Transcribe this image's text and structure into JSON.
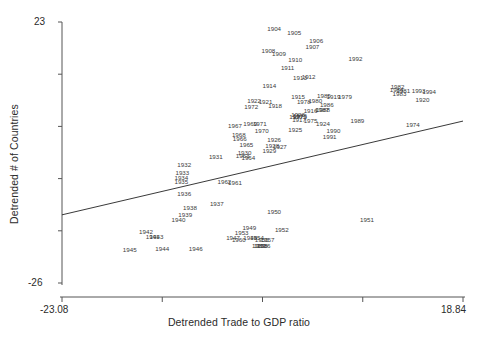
{
  "chart_data": {
    "type": "scatter",
    "title": "",
    "xlabel": "Detrended Trade to GDP ratio",
    "ylabel": "Detrended # of Countries",
    "xlim": [
      -23.08,
      18.84
    ],
    "ylim": [
      -26,
      23
    ],
    "xticklabels": [
      "-23.08",
      "18.84"
    ],
    "yticklabels": [
      "23",
      "-26"
    ],
    "grid": false,
    "legend": null,
    "point_label_field": "year",
    "marker": "text-label",
    "trendline": {
      "type": "linear",
      "x": [
        -23.08,
        18.84
      ],
      "y": [
        -13.2,
        4.4
      ]
    },
    "points": [
      {
        "year": "1904",
        "x": -0.9,
        "y": 21.6
      },
      {
        "year": "1905",
        "x": 1.2,
        "y": 21.0
      },
      {
        "year": "1906",
        "x": 3.5,
        "y": 19.4
      },
      {
        "year": "1907",
        "x": 3.1,
        "y": 18.3
      },
      {
        "year": "1908",
        "x": -1.5,
        "y": 17.6
      },
      {
        "year": "1909",
        "x": -0.4,
        "y": 17.0
      },
      {
        "year": "1910",
        "x": 1.3,
        "y": 15.8
      },
      {
        "year": "1911",
        "x": 0.5,
        "y": 14.4
      },
      {
        "year": "1912",
        "x": 2.7,
        "y": 12.6
      },
      {
        "year": "1913",
        "x": 1.8,
        "y": 12.4
      },
      {
        "year": "1914",
        "x": -1.4,
        "y": 11.0
      },
      {
        "year": "1915",
        "x": 1.6,
        "y": 9.0
      },
      {
        "year": "1916",
        "x": 2.9,
        "y": 6.2
      },
      {
        "year": "1917",
        "x": 1.7,
        "y": 4.6
      },
      {
        "year": "1918",
        "x": -0.8,
        "y": 7.2
      },
      {
        "year": "1919",
        "x": 5.3,
        "y": 9.0
      },
      {
        "year": "1920",
        "x": 14.6,
        "y": 8.4
      },
      {
        "year": "1921",
        "x": -1.8,
        "y": 8.0
      },
      {
        "year": "1922",
        "x": -3.0,
        "y": 8.2
      },
      {
        "year": "1923",
        "x": 1.6,
        "y": 5.6
      },
      {
        "year": "1924",
        "x": 4.2,
        "y": 3.8
      },
      {
        "year": "1925",
        "x": 1.3,
        "y": 2.8
      },
      {
        "year": "1926",
        "x": -0.9,
        "y": 0.8
      },
      {
        "year": "1927",
        "x": -0.3,
        "y": -0.5
      },
      {
        "year": "1928",
        "x": -1.1,
        "y": -0.3
      },
      {
        "year": "1929",
        "x": -1.4,
        "y": -1.2
      },
      {
        "year": "1930",
        "x": -4.0,
        "y": -1.5
      },
      {
        "year": "1931",
        "x": -7.0,
        "y": -2.4
      },
      {
        "year": "1932",
        "x": -10.3,
        "y": -3.8
      },
      {
        "year": "1933",
        "x": -10.5,
        "y": -5.4
      },
      {
        "year": "1934",
        "x": -10.6,
        "y": -6.2
      },
      {
        "year": "1935",
        "x": -10.6,
        "y": -7.0
      },
      {
        "year": "1936",
        "x": -10.3,
        "y": -9.3
      },
      {
        "year": "1937",
        "x": -6.9,
        "y": -11.2
      },
      {
        "year": "1938",
        "x": -9.7,
        "y": -11.9
      },
      {
        "year": "1939",
        "x": -10.2,
        "y": -13.2
      },
      {
        "year": "1940",
        "x": -10.9,
        "y": -14.1
      },
      {
        "year": "1941",
        "x": -13.6,
        "y": -17.4
      },
      {
        "year": "1942",
        "x": -14.3,
        "y": -16.4
      },
      {
        "year": "1943",
        "x": -13.2,
        "y": -17.4
      },
      {
        "year": "1944",
        "x": -12.6,
        "y": -19.6
      },
      {
        "year": "1945",
        "x": -16.0,
        "y": -19.8
      },
      {
        "year": "1946",
        "x": -9.1,
        "y": -19.6
      },
      {
        "year": "1947",
        "x": -5.2,
        "y": -17.6
      },
      {
        "year": "1948",
        "x": -3.4,
        "y": -17.6
      },
      {
        "year": "1949",
        "x": -3.5,
        "y": -15.7
      },
      {
        "year": "1950",
        "x": -0.9,
        "y": -12.7
      },
      {
        "year": "1951",
        "x": 8.8,
        "y": -14.2
      },
      {
        "year": "1952",
        "x": -0.1,
        "y": -16.0
      },
      {
        "year": "1953",
        "x": -4.3,
        "y": -16.7
      },
      {
        "year": "1954",
        "x": -2.7,
        "y": -17.5
      },
      {
        "year": "1955",
        "x": -2.2,
        "y": -17.9
      },
      {
        "year": "1956",
        "x": -2.0,
        "y": -19.1
      },
      {
        "year": "1957",
        "x": -1.6,
        "y": -17.9
      },
      {
        "year": "1958",
        "x": -2.3,
        "y": -19.1
      },
      {
        "year": "1959",
        "x": -2.5,
        "y": -19.1
      },
      {
        "year": "1960",
        "x": -4.6,
        "y": -18.0
      },
      {
        "year": "1961",
        "x": -5.0,
        "y": -7.3
      },
      {
        "year": "1962",
        "x": -6.1,
        "y": -7.0
      },
      {
        "year": "1963",
        "x": -4.2,
        "y": -2.2
      },
      {
        "year": "1964",
        "x": -3.6,
        "y": -2.5
      },
      {
        "year": "1965",
        "x": -3.8,
        "y": -0.1
      },
      {
        "year": "1966",
        "x": -4.5,
        "y": 1.0
      },
      {
        "year": "1967",
        "x": -5.0,
        "y": 3.4
      },
      {
        "year": "1968",
        "x": -4.6,
        "y": 1.8
      },
      {
        "year": "1969",
        "x": -3.4,
        "y": 3.8
      },
      {
        "year": "1970",
        "x": -2.2,
        "y": 2.6
      },
      {
        "year": "1971",
        "x": -2.4,
        "y": 3.8
      },
      {
        "year": "1972",
        "x": -3.3,
        "y": 7.0
      },
      {
        "year": "1973",
        "x": 1.8,
        "y": 5.2
      },
      {
        "year": "1974",
        "x": 13.6,
        "y": 3.6
      },
      {
        "year": "1975",
        "x": 2.9,
        "y": 4.5
      },
      {
        "year": "1976",
        "x": 1.8,
        "y": 5.4
      },
      {
        "year": "1977",
        "x": 1.4,
        "y": 5.2
      },
      {
        "year": "1978",
        "x": 2.2,
        "y": 8.0
      },
      {
        "year": "1979",
        "x": 6.5,
        "y": 9.0
      },
      {
        "year": "1980",
        "x": 3.4,
        "y": 8.1
      },
      {
        "year": "1981",
        "x": 12.6,
        "y": 10.0
      },
      {
        "year": "1982",
        "x": 12.0,
        "y": 10.8
      },
      {
        "year": "1983",
        "x": 12.2,
        "y": 9.5
      },
      {
        "year": "1984",
        "x": 11.9,
        "y": 10.2
      },
      {
        "year": "1985",
        "x": 4.3,
        "y": 9.2
      },
      {
        "year": "1986",
        "x": 4.6,
        "y": 7.5
      },
      {
        "year": "1987",
        "x": 4.1,
        "y": 6.5
      },
      {
        "year": "1988",
        "x": 4.2,
        "y": 6.4
      },
      {
        "year": "1989",
        "x": 7.8,
        "y": 4.4
      },
      {
        "year": "1990",
        "x": 5.3,
        "y": 2.6
      },
      {
        "year": "1991",
        "x": 4.9,
        "y": 1.4
      },
      {
        "year": "1992",
        "x": 7.6,
        "y": 16.0
      },
      {
        "year": "1993",
        "x": 14.2,
        "y": 10.0
      },
      {
        "year": "1994",
        "x": 15.3,
        "y": 9.8
      }
    ]
  },
  "axes": {
    "x_tick_min": "-23.08",
    "x_tick_max": "18.84",
    "y_tick_max": "23",
    "y_tick_min": "-26",
    "x_title": "Detrended Trade to GDP ratio",
    "y_title": "Detrended # of Countries"
  },
  "style": {
    "axis_color": "#555555",
    "line_color": "#222222",
    "label_color": "#3a3a3a",
    "background": "#ffffff"
  }
}
